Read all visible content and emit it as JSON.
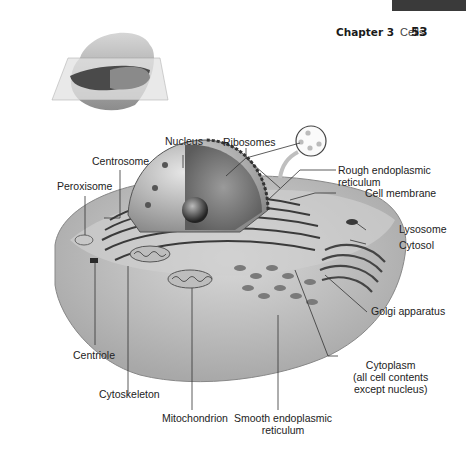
{
  "header": {
    "chapter_label": "Chapter 3",
    "chapter_title": "Cells",
    "page_number": "53"
  },
  "figure": {
    "labels": {
      "nucleus": "Nucleus",
      "centrosome": "Centrosome",
      "ribosomes": "Ribosomes",
      "rough_er_line1": "Rough endoplasmic",
      "rough_er_line2": "reticulum",
      "cell_membrane": "Cell membrane",
      "peroxisome": "Peroxisome",
      "lysosome": "Lysosome",
      "cytosol": "Cytosol",
      "golgi": "Golgi apparatus",
      "centriole": "Centriole",
      "cytoplasm_line1": "Cytoplasm",
      "cytoplasm_line2": "(all cell contents",
      "cytoplasm_line3": "except nucleus)",
      "cytoskeleton": "Cytoskeleton",
      "mitochondrion": "Mitochondrion",
      "smooth_er_line1": "Smooth endoplasmic",
      "smooth_er_line2": "reticulum"
    },
    "colors": {
      "header_band": "#3a3a3a",
      "leader_line": "#333333",
      "cell_gray": "#b8b8b8"
    }
  }
}
